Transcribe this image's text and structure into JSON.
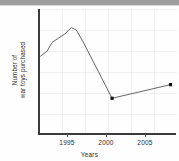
{
  "chart_data": {
    "type": "line",
    "title": "",
    "xlabel": "Years",
    "ylabel_lines": [
      "Number of",
      "war toys purchased"
    ],
    "ylabel": "Number of war toys purchased",
    "xlim": [
      1991,
      2008
    ],
    "ylim": [
      0,
      10
    ],
    "xticks": [
      1995,
      2000,
      2005
    ],
    "xtick_labels": [
      "1995",
      "2000",
      "2005"
    ],
    "yticks": [],
    "ytick_labels": [],
    "grid": true,
    "legend": null,
    "series": [
      {
        "name": "war toys purchased",
        "color": "#555555",
        "marker": "square",
        "x": [
          1991.2,
          1992.0,
          1992.6,
          1993.3,
          1994.2,
          1995.0,
          1995.6,
          1996.4,
          2000.0,
          2007.2
        ],
        "y": [
          6.2,
          6.6,
          7.3,
          7.6,
          8.0,
          8.5,
          8.3,
          7.4,
          2.8,
          3.9
        ],
        "marker_points": [
          {
            "x": 2000.0,
            "y": 2.8
          },
          {
            "x": 2007.2,
            "y": 3.9
          }
        ]
      }
    ],
    "annotations": []
  },
  "colors": {
    "line": "#555555",
    "marker": "#111111",
    "axis": "#3b3b3b",
    "grid": "#d7cdcd",
    "text": "#2b2b2b",
    "page_edge": "#9e9e9e",
    "background": "#fefefe"
  }
}
